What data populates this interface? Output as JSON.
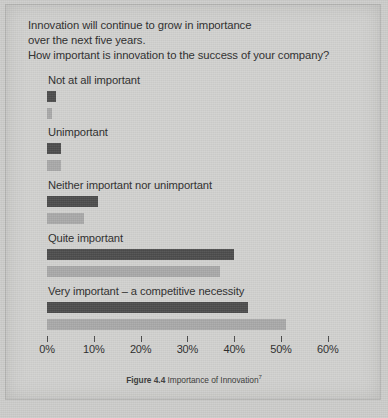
{
  "question": {
    "line1": "Innovation will continue to grow in importance",
    "line2": "over the next five years.",
    "line3": "How important is innovation to the success of your company?"
  },
  "caption": {
    "figure_number": "Figure 4.4",
    "text": " Importance of Innovation",
    "footnote_marker": "7"
  },
  "colors": {
    "series_1": "#4c4c4c",
    "series_2": "#a9a9a9",
    "page_background": "#d2d2d0",
    "text": "#2b2b2b"
  },
  "chart_data": {
    "type": "bar",
    "orientation": "horizontal",
    "title": "Importance of Innovation",
    "xlabel": "",
    "ylabel": "",
    "xlim": [
      0,
      60
    ],
    "grid": false,
    "legend": "none",
    "categories": [
      "Not at all important",
      "Unimportant",
      "Neither important nor unimportant",
      "Quite important",
      "Very important – a competitive necessity"
    ],
    "tick_labels": [
      "0%",
      "10%",
      "20%",
      "30%",
      "40%",
      "50%",
      "60%"
    ],
    "tick_values": [
      0,
      10,
      20,
      30,
      40,
      50,
      60
    ],
    "series": [
      {
        "name": "series-1",
        "color": "#4c4c4c",
        "values": [
          2,
          3,
          11,
          40,
          43
        ],
        "labels": [
          "2%",
          "3%",
          "11%",
          "40%",
          "43%"
        ]
      },
      {
        "name": "series-2",
        "color": "#a9a9a9",
        "values": [
          1,
          3,
          8,
          37,
          51
        ],
        "labels": [
          "1%",
          "3%",
          "8%",
          "37%",
          "51%"
        ]
      }
    ]
  }
}
